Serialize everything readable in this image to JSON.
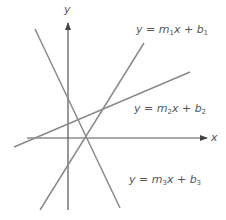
{
  "diagram": {
    "title": "",
    "axes": {
      "x_label": "x",
      "y_label": "y",
      "color": "#555555"
    },
    "lines": [
      {
        "id": "line-1",
        "label": {
          "prefix": "y = m",
          "sub1": "1",
          "mid": "x + b",
          "sub2": "1"
        },
        "description": "steep positive slope",
        "color": "#8a8a8a",
        "from": [
          40,
          210
        ],
        "to": [
          144,
          43
        ]
      },
      {
        "id": "line-2",
        "label": {
          "prefix": "y = m",
          "sub1": "2",
          "mid": "x + b",
          "sub2": "2"
        },
        "description": "shallow positive slope",
        "color": "#8a8a8a",
        "from": [
          14,
          147
        ],
        "to": [
          190,
          72
        ]
      },
      {
        "id": "line-3",
        "label": {
          "prefix": "y = m",
          "sub1": "3",
          "mid": "x + b",
          "sub2": "3"
        },
        "description": "negative slope",
        "color": "#8a8a8a",
        "from": [
          35,
          29
        ],
        "to": [
          120,
          208
        ]
      }
    ]
  }
}
